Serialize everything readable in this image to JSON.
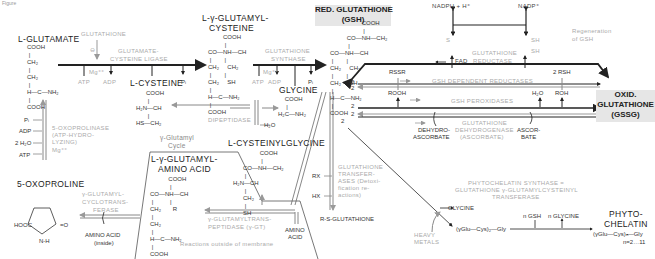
{
  "figure_label": "Figure",
  "compounds": {
    "glutamate": {
      "name": "L-GLUTAMATE",
      "structure": "COOH\n |\nCH₂\n |\nCH₂\n |\nH—C—NH₂\n |\nCOOH"
    },
    "gamma_glutamylcysteine": {
      "name_line1": "L-γ-GLUTAMYL-",
      "name_line2": "CYSTEINE",
      "structure": "         COOH\n          |\nCO—NH—CH\n |        |\nCH₂     CH₂\n |        |\nCH₂     SH\n |\nH—C—NH₂\n |\nCOOH"
    },
    "gsh": {
      "name_line1": "RED. GLUTATHIONE",
      "name_line2": "(GSH)",
      "structure": "                   COOH\n                    |\n          CO—NH—CH₂\n           |\nCO—NH—CH\n |        |\nCH₂     CH₂\n |        |\nCH₂     SH\n |\nH—C—NH₂\n |\nCOOH"
    },
    "gssg": {
      "name_line1": "OXID.",
      "name_line2": "GLUTATHIONE",
      "name_line3": "(GSSG)"
    },
    "cysteine": {
      "name": "L-CYSTEINE",
      "structure": "      COOH\n       |\nH₂N—CH\n       |\nHS—CH₂"
    },
    "glycine": {
      "name": "GLYCINE",
      "structure": "    COOH\n     |\nH₂C—NH₂"
    },
    "cysteinylglycine": {
      "name": "L-CYSTEINYLGLYCINE",
      "structure": "                COOH\n                 |\n      CO—NH—CH₂\n       |\nH₂N—CH\n       |\n      CH₂\n       |\n      SH"
    },
    "gamma_glutamyl_amino_acid": {
      "name_line1": "L-γ-GLUTAMYL-",
      "name_line2": "AMINO ACID",
      "structure": "           COOH\n            |\nCO—NH—CH\n |          |\nCH₂       R\n |\nCH₂\n |\nH—C—NH₂\n |\nCOOH"
    },
    "oxoproline": {
      "name": "5-OXOPROLINE"
    },
    "rs_glutathione": {
      "name": "R-S-GLUTATHIONE"
    },
    "phytochelatin": {
      "name_line1": "PHYTO-",
      "name_line2": "CHELATIN",
      "formula": "(γGlu—Cys)ₙ—Gly",
      "range": "n=2…11"
    },
    "intermediate": {
      "formula": "(γGlu—Cys)₂—Gly"
    },
    "amino_acid_inside": {
      "line1": "AMINO ACID",
      "line2": "(inside)"
    },
    "amino_acid_outside": {
      "line1": "AMINO",
      "line2": "ACID"
    },
    "glycine_release": {
      "name": "GLYCINE"
    },
    "dehydroascorbate": {
      "line1": "DEHYDRO-",
      "line2": "ASCORBATE"
    },
    "ascorbate": {
      "line1": "ASCOR-",
      "line2": "BATE"
    }
  },
  "enzymes": {
    "gcl": {
      "line1": "GLUTAMATE-",
      "line2": "CYSTEINE LIGASE"
    },
    "gs": {
      "line1": "GLUTATHIONE",
      "line2": "SYNTHASE"
    },
    "gr": {
      "line1": "GLUTATHIONE",
      "line2": "REDUCTASE"
    },
    "gsh_red": "GSH DEPENDENT REDUCTASES",
    "gpx": "GSH PEROXIDASES",
    "dhar": {
      "line1": "GLUTATHIONE",
      "line2": "DEHYDROGENASE",
      "line3": "(ASCORBATE)"
    },
    "dipeptidase": "DIPEPTIDASE",
    "oxoprolinase": {
      "line1": "5-OXOPROLINASE",
      "line2": "(ATP-HYDRO-",
      "line3": "LYZING)",
      "line4": "Mg⁺⁺"
    },
    "cyclotransferase": {
      "line1": "γ-GLUTAMYL-",
      "line2": "CYCLOTRANS-",
      "line3": "FERASE"
    },
    "ggt": {
      "line1": "γ-GLUTAMYLTRANS-",
      "line2": "PEPTIDASE (γ-GT)"
    },
    "gst": {
      "line1": "GLUTATHIONE",
      "line2": "TRANSFER-",
      "line3": "ASES (Detoxi-",
      "line4": "fication re-",
      "line5": "actions)"
    },
    "pcs": {
      "line1": "PHYTOCHELATIN SYNTHASE =",
      "line2": "GLUTATHIONE γ-GLUTAMYLCYSTEINYL",
      "line3": "TRANSFERASE"
    }
  },
  "cofactors": {
    "glutathione_inhibitor": "GLUTATHIONE",
    "inhibit_symbol": "⊖",
    "mg": "Mg⁺⁺",
    "atp": "ATP",
    "adp": "ADP",
    "pi": "Pᵢ",
    "h2o": "H₂O",
    "two_h2o": "2 H₂O",
    "nadph": "NADPH + H⁺",
    "nadp": "NADP⁺",
    "fad": "FAD",
    "rssr": "RSSR",
    "two_rsh": "2 RSH",
    "rooh": "ROOH",
    "roh": "ROH",
    "rx": "RX",
    "hx": "HX",
    "heavy_metals": {
      "line1": "HEAVY",
      "line2": "METALS"
    },
    "n_gsh": "n GSH",
    "n_glycine": "n GLYCINE",
    "two": "2",
    "s_label": "S",
    "sh_label": "SH"
  },
  "annotations": {
    "cycle": {
      "line1": "γ-Glutamyl",
      "line2": "Cycle"
    },
    "regeneration": {
      "line1": "Regeneration",
      "line2": "of GSH"
    },
    "outside_membrane": "Reactions outside of membrane"
  },
  "colors": {
    "ink": "#222222",
    "enzyme_text": "#aaaaaa",
    "box_fill": "#e6e6e6",
    "double_arrow": "#888888"
  }
}
